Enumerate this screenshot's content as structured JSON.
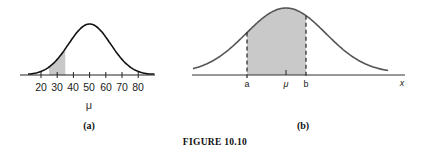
{
  "figure": {
    "caption": "FIGURE 10.10"
  },
  "panel_a": {
    "label": "(a)",
    "xlabel": "μ",
    "ticks": [
      "20",
      "30",
      "40",
      "50",
      "60",
      "70",
      "80"
    ]
  },
  "panel_b": {
    "label": "(b)",
    "xlabel": "x",
    "markers": {
      "a": "a",
      "mu": "μ",
      "b": "b"
    }
  },
  "colors": {
    "curve_a": "#111111",
    "curve_b": "#555555",
    "shade": "#c8c8c8",
    "axis": "#222222"
  },
  "chart_data": [
    {
      "type": "area",
      "title": "(a)",
      "description": "Normal density curve centered at 50 with shaded region between 25 and 35",
      "xlabel": "μ",
      "ylabel": "",
      "x_ticks": [
        20,
        30,
        40,
        50,
        60,
        70,
        80
      ],
      "xlim": [
        12,
        90
      ],
      "distribution": {
        "kind": "normal",
        "mean": 50,
        "sd": 13
      },
      "shaded_interval": [
        25,
        35
      ],
      "grid": false,
      "legend": null
    },
    {
      "type": "area",
      "title": "(b)",
      "description": "Normal density curve centered at μ with shaded area between a and b (dashed vertical lines)",
      "xlabel": "x",
      "ylabel": "",
      "x_markers": [
        "a",
        "μ",
        "b"
      ],
      "distribution": {
        "kind": "normal",
        "mean": "μ"
      },
      "shaded_interval": [
        "a",
        "b"
      ],
      "grid": false,
      "legend": null
    }
  ]
}
